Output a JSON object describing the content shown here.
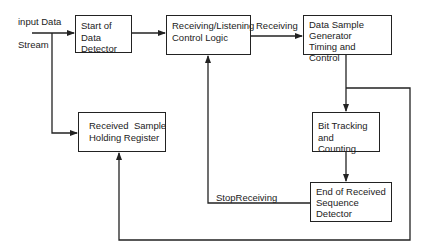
{
  "inputs": {
    "line1": "input Data",
    "line2": "Stream"
  },
  "blocks": {
    "start_detector": {
      "line1": "Start of Data",
      "line2": "Detector"
    },
    "control_logic": {
      "line1": "Receiving/Listening",
      "line2": "Control Logic"
    },
    "sample_generator": {
      "line1": "Data Sample",
      "line2": "Generator",
      "line3": "Timing and Control"
    },
    "bit_tracking": {
      "line1": "Bit Tracking",
      "line2": "and Counting"
    },
    "end_detector": {
      "line1": "End of Received",
      "line2": "Sequence",
      "line3": "Detector"
    },
    "holding_register": {
      "line1": "Received  Sample",
      "line2": "Holding Register"
    }
  },
  "signals": {
    "receiving": "Receiving",
    "stop_receiving": "StopReceiving"
  },
  "colors": {
    "stroke": "#222222",
    "background": "#ffffff"
  }
}
